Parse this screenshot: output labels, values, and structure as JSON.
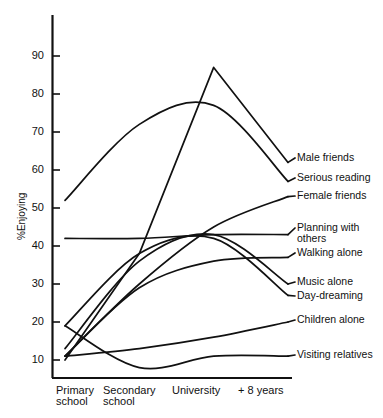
{
  "chart_data": {
    "type": "line",
    "title": "",
    "xlabel": "",
    "ylabel": "%Enjoying",
    "categories": [
      "Primary\nschool",
      "Secondary\nschool",
      "University",
      "+ 8 years"
    ],
    "x": [
      0,
      1,
      2,
      3
    ],
    "yticks": [
      10,
      20,
      30,
      40,
      50,
      60,
      70,
      80,
      90
    ],
    "ylim": [
      6,
      95
    ],
    "grid": false,
    "legend_position": "right-inline",
    "series": [
      {
        "name": "Male friends",
        "values": [
          10,
          38,
          87,
          62
        ]
      },
      {
        "name": "Serious reading",
        "values": [
          52,
          72,
          77,
          57
        ]
      },
      {
        "name": "Female friends",
        "values": [
          11,
          30,
          45,
          53
        ]
      },
      {
        "name": "Planning with\nothers",
        "values": [
          42,
          42,
          43,
          43
        ]
      },
      {
        "name": "Walking alone",
        "values": [
          11,
          29,
          36,
          37
        ]
      },
      {
        "name": "Music alone",
        "values": [
          13,
          36,
          43,
          30
        ]
      },
      {
        "name": "Day-dreaming",
        "values": [
          19,
          38,
          42,
          27
        ]
      },
      {
        "name": "Children alone",
        "values": [
          11,
          13,
          16,
          20
        ]
      },
      {
        "name": "Visiting relatives",
        "values": [
          19,
          8,
          11,
          11
        ]
      }
    ]
  },
  "axis": {
    "ytick_labels": [
      "90",
      "80",
      "70",
      "60",
      "50",
      "40",
      "30",
      "20",
      "10"
    ],
    "ylabel_text": "%Enjoying"
  },
  "legend": {
    "items": [
      {
        "label": "Male friends"
      },
      {
        "label": "Serious reading"
      },
      {
        "label": "Female friends"
      },
      {
        "label": "Planning with\nothers"
      },
      {
        "label": "Walking alone"
      },
      {
        "label": "Music alone"
      },
      {
        "label": "Day-dreaming"
      },
      {
        "label": "Children alone"
      },
      {
        "label": "Visiting relatives"
      }
    ]
  },
  "xaxis": {
    "categories": [
      "Primary\nschool",
      "Secondary\nschool",
      "University",
      "+ 8 years"
    ]
  },
  "colors": {
    "line": "#111111",
    "axis": "#111111",
    "background": "#ffffff"
  }
}
